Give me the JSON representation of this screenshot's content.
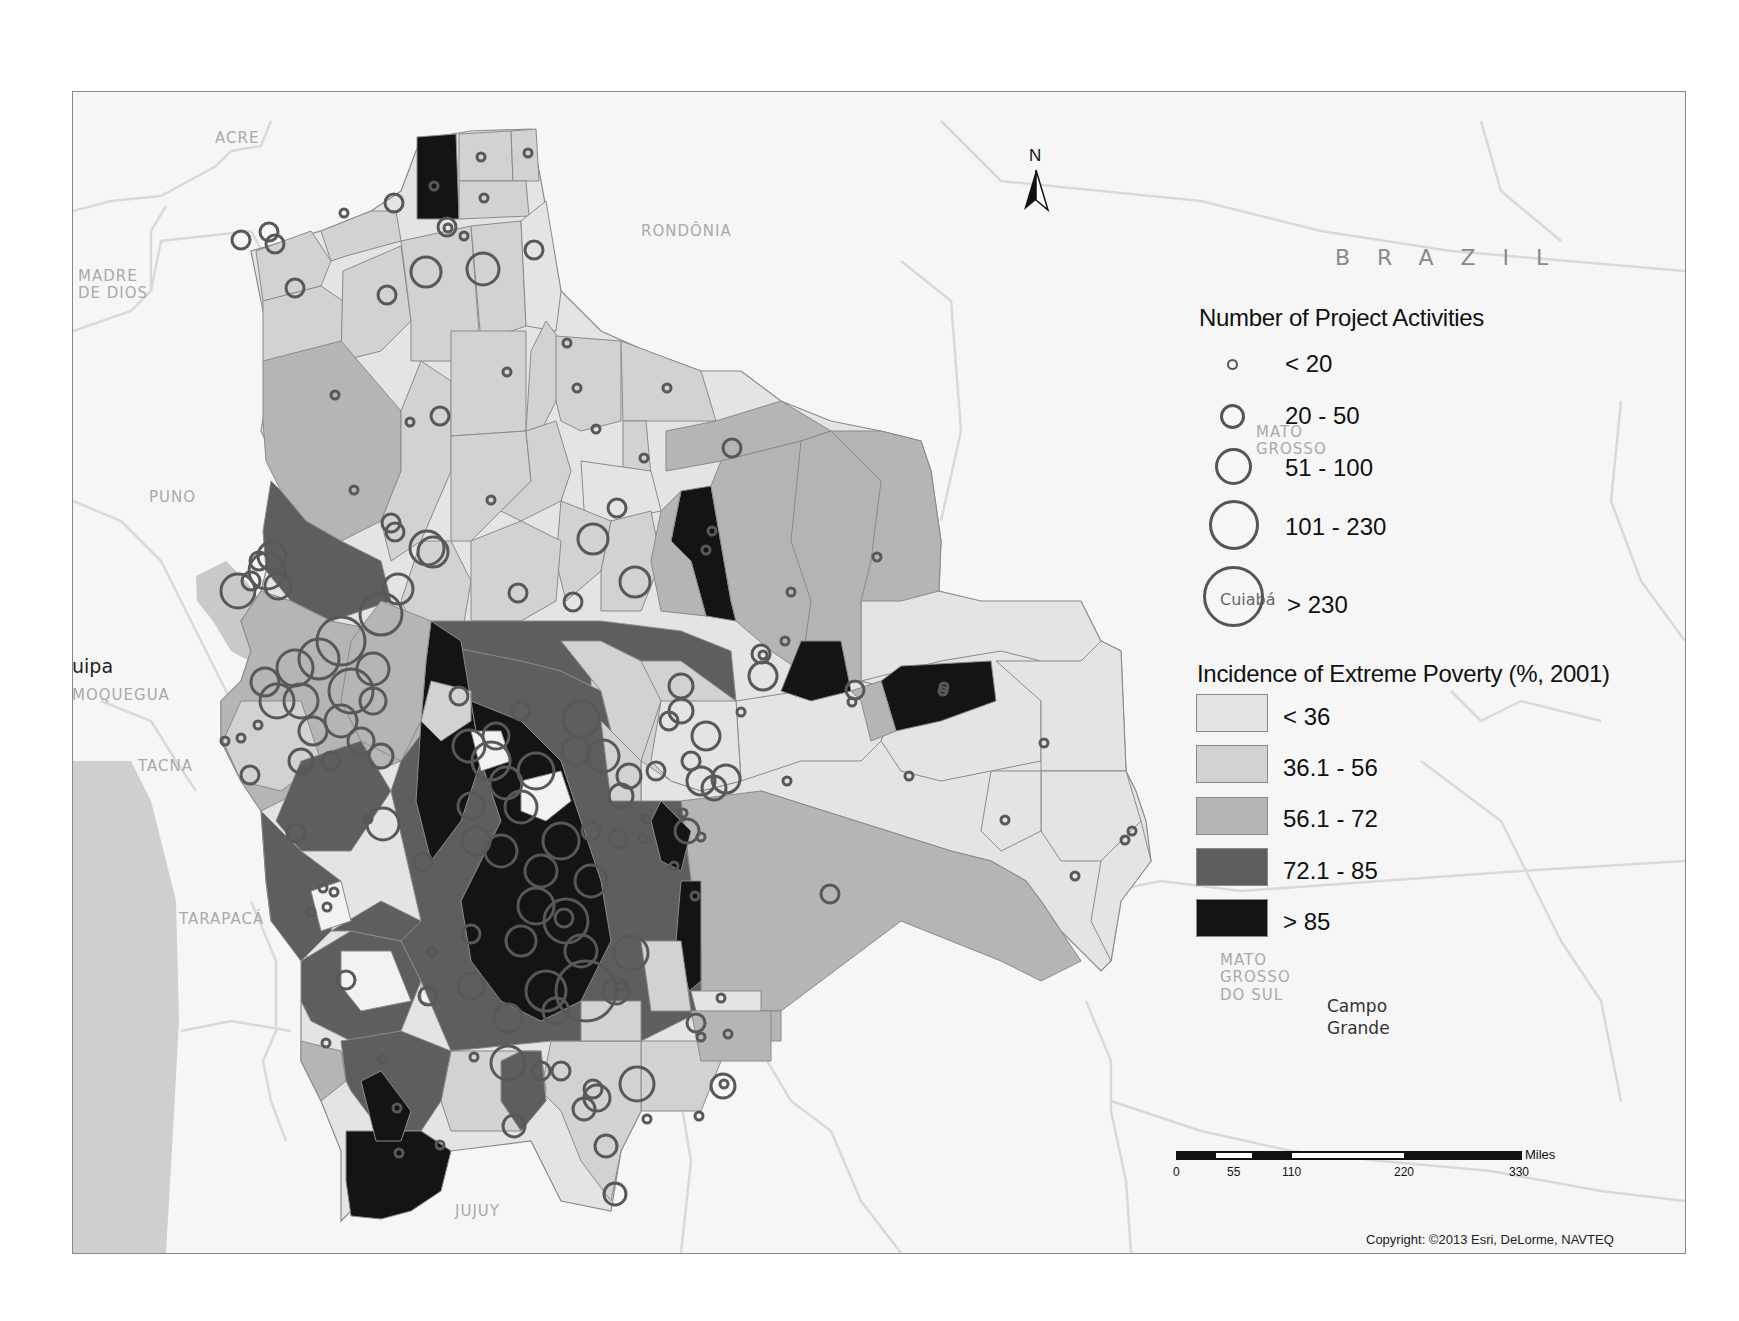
{
  "map": {
    "title": "Bolivia: Project Activities and Incidence of Extreme Poverty",
    "north_arrow_label": "N",
    "country_label": "BRAZIL",
    "geo_labels": [
      {
        "text": "ACRE",
        "x": 215,
        "y": 130
      },
      {
        "text": "RONDÔNIA",
        "x": 641,
        "y": 223
      },
      {
        "text": "MADRE\nDE DIOS",
        "x": 78,
        "y": 268
      },
      {
        "text": "PUNO",
        "x": 149,
        "y": 489
      },
      {
        "text": "MOQUEGUA",
        "x": 72,
        "y": 687
      },
      {
        "text": "TACNA",
        "x": 138,
        "y": 758
      },
      {
        "text": "TARAPACÁ",
        "x": 179,
        "y": 911
      },
      {
        "text": "JUJUY",
        "x": 455,
        "y": 1203
      },
      {
        "text": "MATO\nGROSSO",
        "x": 1256,
        "y": 424
      },
      {
        "text": "MATO\nGROSSO\nDO SUL",
        "x": 1220,
        "y": 952
      }
    ],
    "city_labels": [
      {
        "text": "Arequipa",
        "visible_text": "uipa",
        "x": 72,
        "y": 654
      },
      {
        "text": "Cuiabá",
        "x": 1220,
        "y": 590
      },
      {
        "text": "Campo\nGrande",
        "x": 1327,
        "y": 995
      }
    ],
    "copyright": "Copyright: ©2013 Esri, DeLorme, NAVTEQ"
  },
  "legend_points": {
    "title": "Number of Project Activities",
    "items": [
      {
        "label": "< 20",
        "diameter": 10
      },
      {
        "label": "20 - 50",
        "diameter": 24
      },
      {
        "label": "51 - 100",
        "diameter": 36
      },
      {
        "label": "101 - 230",
        "diameter": 50
      },
      {
        "label": "> 230",
        "diameter": 62
      }
    ]
  },
  "legend_poverty": {
    "title": "Incidence of Extreme Poverty (%, 2001)",
    "items": [
      {
        "label": "< 36",
        "color": "#e4e4e4"
      },
      {
        "label": "36.1 - 56",
        "color": "#d2d2d2"
      },
      {
        "label": "56.1 - 72",
        "color": "#b5b5b5"
      },
      {
        "label": "72.1 - 85",
        "color": "#5e5e5e"
      },
      {
        "label": "> 85",
        "color": "#141414"
      }
    ]
  },
  "scalebar": {
    "unit": "Miles",
    "ticks": [
      "0",
      "55",
      "110",
      "220",
      "330"
    ]
  },
  "colors": {
    "ocean": "#cfcfcf",
    "land_background": "#f6f6f6",
    "boundary": "#d6d6d6",
    "circle_stroke": "#585858"
  }
}
